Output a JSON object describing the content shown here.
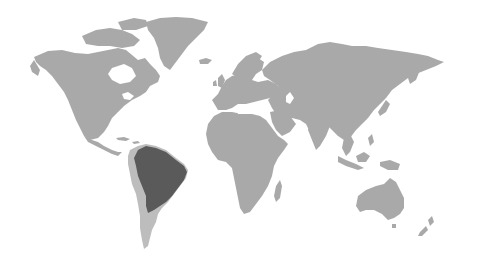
{
  "map": {
    "type": "world-map",
    "projection": "equirectangular-like",
    "colors": {
      "background": "#ffffff",
      "land": "#a9a9a9",
      "highlight": "#5a5a5a",
      "highlight_secondary": "#bdbdbd"
    },
    "highlighted_regions": [
      {
        "name": "Brazil / Amazon basin region",
        "shade": "dark"
      },
      {
        "name": "Western South America / Andes",
        "shade": "light"
      }
    ],
    "continents": [
      "North America",
      "Greenland",
      "South America",
      "Europe",
      "Africa",
      "Asia",
      "Australia",
      "New Zealand"
    ]
  }
}
